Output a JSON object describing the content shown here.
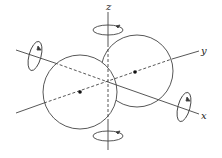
{
  "diagram": {
    "title": "",
    "axes": [
      {
        "name": "x",
        "label": "x"
      },
      {
        "name": "y",
        "label": "y"
      },
      {
        "name": "z",
        "label": "z"
      }
    ],
    "spheres": [
      {
        "name": "left-sphere",
        "center_dot": true
      },
      {
        "name": "right-sphere",
        "center_dot": true
      }
    ],
    "rotation_arrows": [
      "x-axis",
      "z-axis-top",
      "z-axis-bottom",
      "x-axis-right"
    ],
    "colors": {
      "line": "#333333",
      "background": "#ffffff"
    }
  }
}
